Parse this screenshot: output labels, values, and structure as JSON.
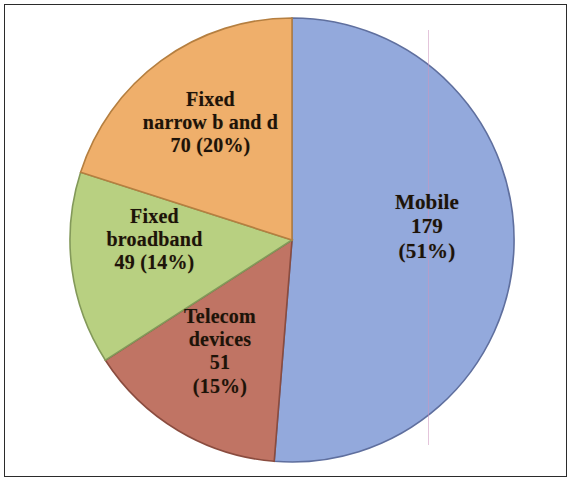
{
  "figure": {
    "border_color": "#2b2b2b",
    "background_color": "#ffffff",
    "artifact_note": "faint pink vertical scan line across blue slice"
  },
  "chart_data": {
    "type": "pie",
    "title": "",
    "subtitle": "",
    "xlabel": "",
    "ylabel": "",
    "legend_position": "none",
    "grid": false,
    "total": 349,
    "start_angle_deg": 0,
    "direction": "clockwise",
    "center": {
      "x": 292,
      "y": 240
    },
    "radius": 222,
    "categories": [
      "Mobile",
      "Telecom devices",
      "Fixed broadband",
      "Fixed narrow b and d"
    ],
    "values": [
      179,
      51,
      49,
      70
    ],
    "percents": [
      51,
      15,
      14,
      20
    ],
    "colors": [
      "#93a9dc",
      "#c07464",
      "#b8d081",
      "#efaf6b"
    ],
    "slices": [
      {
        "name": "Mobile",
        "value": 179,
        "percent": 51,
        "color": "#93a9dc",
        "edge_color": "#5f6f9e",
        "start_deg": 0,
        "end_deg": 184.6,
        "label_lines": [
          "Mobile",
          "179",
          "(51%)"
        ]
      },
      {
        "name": "Telecom devices",
        "value": 51,
        "percent": 15,
        "color": "#c07464",
        "edge_color": "#8a4c3f",
        "start_deg": 184.6,
        "end_deg": 237.2,
        "label_lines": [
          "Telecom",
          "devices",
          "51",
          "(15%)"
        ]
      },
      {
        "name": "Fixed broadband",
        "value": 49,
        "percent": 14,
        "color": "#b8d081",
        "edge_color": "#83995a",
        "start_deg": 237.2,
        "end_deg": 287.8,
        "label_lines": [
          "Fixed",
          "broadband",
          "49  (14%)"
        ]
      },
      {
        "name": "Fixed narrow b and d",
        "value": 70,
        "percent": 20,
        "color": "#efaf6b",
        "edge_color": "#b57f40",
        "start_deg": 287.8,
        "end_deg": 360,
        "label_lines": [
          "Fixed",
          "narrow b and d",
          "70  (20%)"
        ]
      }
    ]
  }
}
